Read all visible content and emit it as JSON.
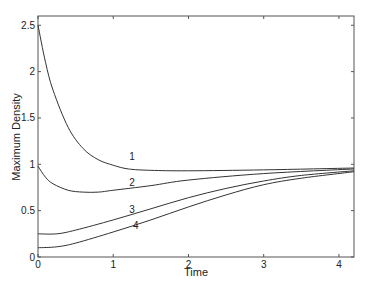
{
  "chart_data": {
    "type": "line",
    "title": "",
    "xlabel": "Time",
    "ylabel": "Maximum Density",
    "xlim": [
      0,
      4.2
    ],
    "ylim": [
      0,
      2.6
    ],
    "xticks": [
      0,
      1,
      2,
      3,
      4
    ],
    "yticks": [
      0,
      0.5,
      1,
      1.5,
      2,
      2.5
    ],
    "xtick_labels": [
      "0",
      "1",
      "2",
      "3",
      "4"
    ],
    "ytick_labels": [
      "0",
      "0.5",
      "1",
      "1.5",
      "2",
      "2.5"
    ],
    "grid": false,
    "legend": "inline curve labels",
    "series": [
      {
        "name": "1",
        "x": [
          0,
          0.1,
          0.2,
          0.4,
          0.6,
          0.8,
          1.0,
          1.2,
          1.5,
          2.0,
          3.0,
          4.2
        ],
        "values": [
          2.5,
          2.1,
          1.8,
          1.4,
          1.17,
          1.05,
          0.99,
          0.95,
          0.935,
          0.93,
          0.94,
          0.96
        ]
      },
      {
        "name": "2",
        "x": [
          0,
          0.1,
          0.2,
          0.4,
          0.6,
          0.8,
          1.0,
          1.5,
          2.0,
          3.0,
          4.2
        ],
        "values": [
          0.98,
          0.86,
          0.79,
          0.72,
          0.7,
          0.7,
          0.72,
          0.77,
          0.83,
          0.9,
          0.95
        ]
      },
      {
        "name": "3",
        "x": [
          0,
          0.25,
          0.5,
          1.0,
          1.5,
          2.0,
          2.5,
          3.0,
          3.5,
          4.2
        ],
        "values": [
          0.25,
          0.25,
          0.29,
          0.4,
          0.52,
          0.64,
          0.74,
          0.82,
          0.88,
          0.93
        ]
      },
      {
        "name": "4",
        "x": [
          0,
          0.25,
          0.5,
          1.0,
          1.5,
          2.0,
          2.5,
          3.0,
          3.5,
          4.2
        ],
        "values": [
          0.1,
          0.11,
          0.15,
          0.27,
          0.4,
          0.54,
          0.67,
          0.78,
          0.85,
          0.92
        ]
      }
    ],
    "annotations": [
      {
        "text": "1",
        "x": 1.25,
        "y": 1.05
      },
      {
        "text": "2",
        "x": 1.25,
        "y": 0.77
      },
      {
        "text": "3",
        "x": 1.25,
        "y": 0.48
      },
      {
        "text": "4",
        "x": 1.3,
        "y": 0.3
      }
    ]
  },
  "colors": {
    "line": "#333333",
    "axis": "#555555"
  }
}
